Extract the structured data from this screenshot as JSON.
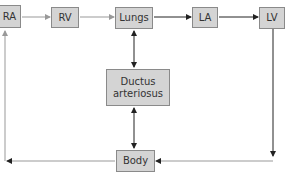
{
  "diagram": {
    "nodes": {
      "ra": "RA",
      "rv": "RV",
      "lungs": "Lungs",
      "la": "LA",
      "lv": "LV",
      "ductus_line1": "Ductus",
      "ductus_line2": "arteriosus",
      "body": "Body"
    },
    "edges": [
      {
        "from": "RA",
        "to": "RV"
      },
      {
        "from": "RV",
        "to": "Lungs"
      },
      {
        "from": "Lungs",
        "to": "LA"
      },
      {
        "from": "LA",
        "to": "LV"
      },
      {
        "from": "LV",
        "to": "Body"
      },
      {
        "from": "Body",
        "to": "RA"
      },
      {
        "from": "Lungs",
        "to": "Ductus arteriosus",
        "bidirectional": true
      },
      {
        "from": "Ductus arteriosus",
        "to": "Body",
        "bidirectional": true
      }
    ],
    "colors": {
      "box_fill": "#d4d4d4",
      "box_border": "#8a8a8a",
      "arrow_dark": "#222222",
      "arrow_light": "#999999"
    }
  }
}
